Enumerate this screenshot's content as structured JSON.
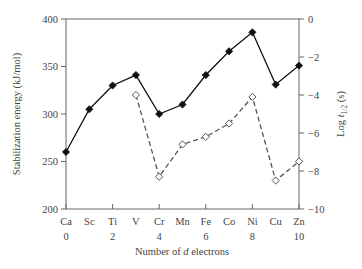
{
  "chart_data": {
    "type": "line",
    "title": "",
    "xlabel": "Number of d electrons",
    "xlabel_parts": [
      "Number of ",
      "d",
      " electrons"
    ],
    "ylabel": "Stabilization energy (kJ/mol)",
    "y2label": "Log t1/2 (s)",
    "y2label_parts": [
      "Log ",
      "t",
      "1/2",
      " (s)"
    ],
    "categories": [
      "Ca",
      "Sc",
      "Ti",
      "V",
      "Cr",
      "Mn",
      "Fe",
      "Co",
      "Ni",
      "Cu",
      "Zn"
    ],
    "x_numbers": [
      {
        "label": "0",
        "index": 0
      },
      {
        "label": "2",
        "index": 2
      },
      {
        "label": "4",
        "index": 4
      },
      {
        "label": "6",
        "index": 6
      },
      {
        "label": "8",
        "index": 8
      },
      {
        "label": "10",
        "index": 10
      }
    ],
    "ylim": [
      200,
      400
    ],
    "yticks": [
      200,
      250,
      300,
      350,
      400
    ],
    "y2lim": [
      -10,
      0
    ],
    "y2ticks": [
      0,
      -2,
      -4,
      -6,
      -8,
      -10
    ],
    "y2tick_labels": [
      "0",
      "−2",
      "−4",
      "−6",
      "−8",
      "−10"
    ],
    "grid": false,
    "legend": null,
    "series": [
      {
        "name": "Stabilization energy (kJ/mol)",
        "axis": "left",
        "style": "solid",
        "marker": "filled-diamond",
        "color": "#111111",
        "values": [
          260,
          305,
          330,
          341,
          300,
          310,
          341,
          366,
          386,
          331,
          351
        ]
      },
      {
        "name": "Log t1/2 (s)",
        "axis": "right",
        "style": "dashed",
        "marker": "open-diamond",
        "color": "#555555",
        "values": [
          null,
          null,
          null,
          -4.0,
          -8.3,
          -6.6,
          -6.2,
          -5.5,
          -4.1,
          -8.5,
          -7.5
        ]
      }
    ]
  }
}
